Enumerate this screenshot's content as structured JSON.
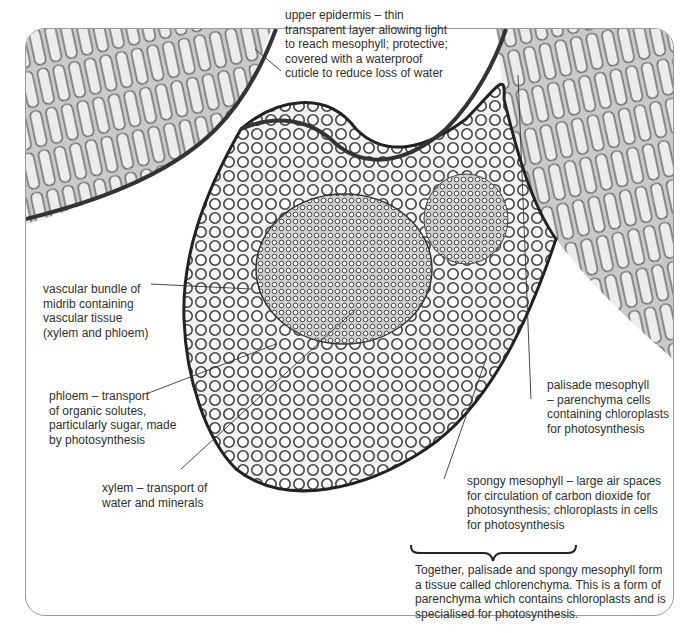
{
  "figure": {
    "labels": {
      "upper_epidermis": [
        "upper epidermis – thin",
        "transparent layer allowing light",
        "to reach mesophyll; protective;",
        "covered with a waterproof",
        "cuticle to reduce loss of water"
      ],
      "vascular_bundle": [
        "vascular bundle of",
        "midrib containing",
        "vascular tissue",
        "(xylem and phloem)"
      ],
      "phloem": [
        "phloem – transport",
        "of organic solutes,",
        "particularly sugar, made",
        "by photosynthesis"
      ],
      "xylem": [
        "xylem  – transport of",
        "water and minerals"
      ],
      "palisade_mesophyll": [
        "palisade mesophyll",
        "– parenchyma cells",
        "containing chloroplasts",
        "for photosynthesis"
      ],
      "spongy_mesophyll": [
        "spongy mesophyll – large air spaces",
        "for circulation of carbon dioxide for",
        "photosynthesis; chloroplasts in cells",
        "for photosynthesis"
      ],
      "chlorenchyma_note": [
        "Together, palisade and spongy mesophyll form",
        "a tissue called chlorenchyma. This is a form of",
        "parenchyma which contains chloroplasts and is",
        "specialised for photosynthesis."
      ]
    },
    "colors": {
      "frame_border": "#9a9a9a",
      "text": "#2f2f2f",
      "leader_line": "#333333",
      "tissue_dark": "#3a3a3a",
      "tissue_light": "#d8d8d8"
    }
  }
}
